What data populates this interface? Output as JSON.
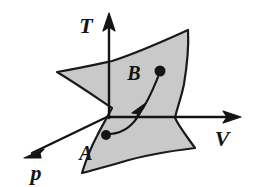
{
  "figure": {
    "background_color": "#ffffff",
    "ink_color": "#141414",
    "surface_fill_color": "#c9c9c9",
    "surface_stroke_color": "#1a1a1a"
  },
  "axes": [
    {
      "id": "temperature",
      "label": "T",
      "icon": "axis-arrow-up-icon",
      "direction": "up",
      "tip": {
        "x": 109,
        "y": 14
      },
      "label_pos": {
        "x": 86,
        "y": 33
      }
    },
    {
      "id": "volume",
      "label": "V",
      "icon": "axis-arrow-right-icon",
      "direction": "right",
      "tip": {
        "x": 240,
        "y": 117
      },
      "label_pos": {
        "x": 222,
        "y": 146
      }
    },
    {
      "id": "pressure",
      "label": "p",
      "icon": "axis-arrow-down-left-icon",
      "direction": "down-left",
      "tip": {
        "x": 24,
        "y": 158
      },
      "label_pos": {
        "x": 36,
        "y": 180
      }
    }
  ],
  "origin": {
    "x": 109,
    "y": 116
  },
  "points": [
    {
      "id": "state-a",
      "label": "A",
      "dot": {
        "x": 106,
        "y": 135,
        "r": 5
      },
      "label_pos": {
        "x": 86,
        "y": 160
      }
    },
    {
      "id": "state-b",
      "label": "B",
      "dot": {
        "x": 160,
        "y": 71,
        "r": 5.5
      },
      "label_pos": {
        "x": 134,
        "y": 80
      }
    }
  ],
  "path": {
    "id": "process-path-a-to-b",
    "from": "A",
    "to": "B",
    "has_arrowhead": true,
    "arrowhead_pos": {
      "x": 141,
      "y": 110
    },
    "d": "M 110 134 C 124 133 133 126 140 113 C 150 98 155 84 158 77"
  },
  "surface": {
    "id": "state-surface",
    "outline_d": "M 57 72 C 80 68 98 64 112 61 C 140 52 168 39 188 30 C 189 48 187 66 184 84 C 181 99 177 108 175 118 C 180 128 188 138 195 148 C 170 151 145 155 122 162 C 108 166 94 170 82 173 C 86 160 91 147 97 136 C 103 124 108 116 112 108 C 100 100 80 86 57 72 Z"
  }
}
